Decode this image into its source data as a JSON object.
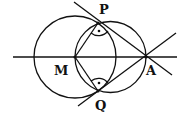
{
  "diagram": {
    "points": {
      "P": {
        "label": "P",
        "x": 98,
        "y": 23
      },
      "Q": {
        "label": "Q",
        "x": 98,
        "y": 91
      },
      "M": {
        "label": "M",
        "x": 75,
        "y": 57
      },
      "A": {
        "label": "A",
        "x": 146,
        "y": 57
      }
    },
    "labels": {
      "P": "P",
      "Q": "Q",
      "M": "M",
      "A": "A"
    },
    "stroke_color": "#111111"
  }
}
